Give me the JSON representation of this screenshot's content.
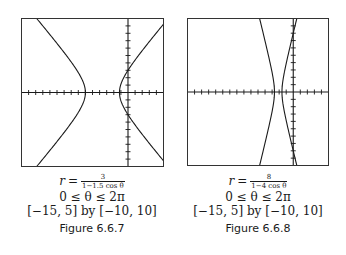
{
  "chart_data": [
    {
      "type": "line",
      "title": "Figure 6.6.7",
      "equation": {
        "lhs": "r",
        "numerator": "3",
        "denominator": "1−1.5 cos θ"
      },
      "theta_range": "0 ≤ θ ≤ 2π",
      "window_text": "[−15, 5] by [−10, 10]",
      "xlim": [
        -15,
        5
      ],
      "ylim": [
        -10,
        10
      ],
      "xtick_step": 1,
      "ytick_step": 1,
      "grid": false,
      "curve": {
        "kind": "polar_conic",
        "ed": 3,
        "e": 1.5,
        "vertices_x": [
          -6,
          -1.2
        ]
      }
    },
    {
      "type": "line",
      "title": "Figure 6.6.8",
      "equation": {
        "lhs": "r",
        "numerator": "8",
        "denominator": "1−4 cos θ"
      },
      "theta_range": "0 ≤ θ ≤ 2π",
      "window_text": "[−15, 5] by [−10, 10]",
      "xlim": [
        -15,
        5
      ],
      "ylim": [
        -10,
        10
      ],
      "xtick_step": 1,
      "ytick_step": 1,
      "grid": false,
      "curve": {
        "kind": "polar_conic",
        "ed": 8,
        "e": 4,
        "vertices_x": [
          -2.667,
          -1.6
        ]
      }
    }
  ],
  "figures": [
    {
      "eq_lhs": "r",
      "eq_sign": "=",
      "eq_num": "3",
      "eq_den": "1−1.5 cos θ",
      "theta_range": "0 ≤ θ ≤ 2π",
      "window": "[−15, 5] by [−10, 10]",
      "label": "Figure 6.6.7"
    },
    {
      "eq_lhs": "r",
      "eq_sign": "=",
      "eq_num": "8",
      "eq_den": "1−4 cos θ",
      "theta_range": "0 ≤ θ ≤ 2π",
      "window": "[−15, 5] by [−10, 10]",
      "label": "Figure 6.6.8"
    }
  ],
  "colors": {
    "ink": "#1a1a1a",
    "frame": "#333333",
    "background": "#ffffff"
  }
}
